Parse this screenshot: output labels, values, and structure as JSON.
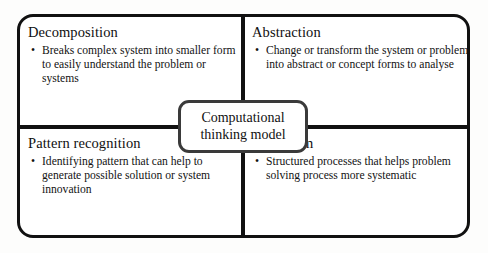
{
  "diagram": {
    "title": "Computational thinking model",
    "center": {
      "label": "Computational\nthinking model"
    },
    "bullet_glyph": "•",
    "colors": {
      "frame_border": "#111111",
      "center_border": "#3a3a3a",
      "page_background": "#fdfdfc",
      "panel_background": "#ffffff",
      "text": "#111111"
    },
    "quadrants": [
      {
        "id": "decomposition",
        "title": "Decomposition",
        "bullets": [
          "Breaks complex system into smaller form to easily understand the problem or systems"
        ]
      },
      {
        "id": "abstraction",
        "title": "Abstraction",
        "bullets": [
          "Change or transform the system or problem into abstract or concept forms to analyse"
        ]
      },
      {
        "id": "pattern-recognition",
        "title": "Pattern recognition",
        "bullets": [
          "Identifying pattern that can help to generate possible solution or system innovation"
        ]
      },
      {
        "id": "algorithm",
        "title": "Algorithm",
        "bullets": [
          "Structured processes that helps problem solving process more systematic"
        ]
      }
    ]
  }
}
